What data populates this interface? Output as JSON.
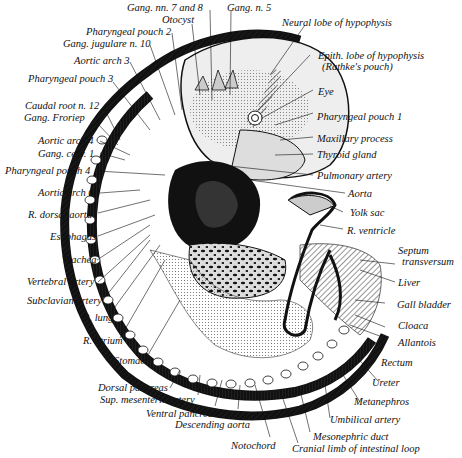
{
  "figure": {
    "ink_color": "#111111",
    "background": "#ffffff"
  },
  "labels": {
    "gang_nn_7_8": "Gang. nn. 7 and 8",
    "gang_n5": "Gang. n. 5",
    "otocyst": "Otocyst",
    "pharyngeal_pouch_2": "Pharyngeal pouch 2",
    "gang_jugulare": "Gang. jugulare n. 10",
    "aortic_arch_3": "Aortic arch 3",
    "pharyngeal_pouch_3": "Pharyngeal pouch 3",
    "caudal_root": "Caudal root n. 12",
    "gang_froriep": "Gang. Froriep",
    "aortic_arch_4": "Aortic arch 4",
    "gang_cerv": "Gang. cerv. 1",
    "pharyngeal_pouch_4": "Pharyngeal pouch 4",
    "aortic_arch_6": "Aortic arch 6",
    "r_dorsal_aorta": "R. dorsal aorta",
    "esophagus": "Esophagus",
    "trachea": "Trachea",
    "vertebral_artery": "Vertebral artery",
    "subclavian_artery": "Subclavian artery",
    "r_lung": "R. lung",
    "r_atrium": "R. atrium",
    "stomach": "Stomach",
    "dorsal_pancreas": "Dorsal pancreas",
    "sup_mesenteric": "Sup. mesenteric artery",
    "ventral_pancreas": "Ventral pancreas",
    "descending_aorta": "Descending aorta",
    "notochord": "Notochord",
    "cranial_limb": "Cranial limb of intestinal loop",
    "mesonephric_duct": "Mesonephric duct",
    "umbilical_artery": "Umbilical artery",
    "metanephros": "Metanephros",
    "ureter": "Ureter",
    "rectum": "Rectum",
    "allantois": "Allantois",
    "cloaca": "Cloaca",
    "gall_bladder": "Gall bladder",
    "liver": "Liver",
    "septum_1": "Septum",
    "septum_2": "transversum",
    "r_ventricle": "R. ventricle",
    "yolk_sac": "Yolk sac",
    "aorta": "Aorta",
    "pulmonary_artery": "Pulmonary artery",
    "thyroid_gland": "Thyroid gland",
    "maxillary_process": "Maxillary process",
    "pharyngeal_pouch_1": "Pharyngeal pouch 1",
    "eye": "Eye",
    "epith_lobe_1": "Epith. lobe of hypophysis",
    "epith_lobe_2": "(Rathke's pouch)",
    "neural_lobe": "Neural lobe of hypophysis"
  }
}
